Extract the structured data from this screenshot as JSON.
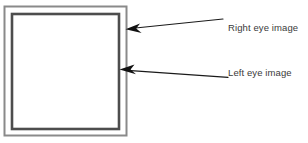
{
  "diagram": {
    "canvas": {
      "width": 308,
      "height": 143,
      "background": "#ffffff"
    },
    "shapes": {
      "outer_frame": {
        "name": "right-eye-image-frame",
        "x": 4.5,
        "y": 6.5,
        "width": 122,
        "height": 129,
        "stroke": "#8a8a8a",
        "stroke_width": 2,
        "fill": "#ffffff"
      },
      "inner_frame": {
        "name": "left-eye-image-frame",
        "x": 12,
        "y": 14,
        "width": 107,
        "height": 115,
        "stroke": "#4d4d4d",
        "stroke_width": 2.6,
        "fill": "#ffffff"
      }
    },
    "callouts": [
      {
        "id": "right-eye",
        "label": "Right eye image",
        "target": "outer_frame",
        "tip_x": 126,
        "tip_y": 29,
        "tail_x": 223,
        "tail_y": 19,
        "color": "#1a1a1a"
      },
      {
        "id": "left-eye",
        "label": "Left eye image",
        "target": "inner_frame",
        "tip_x": 120,
        "tip_y": 70,
        "tail_x": 228,
        "tail_y": 77,
        "color": "#1a1a1a"
      }
    ]
  }
}
